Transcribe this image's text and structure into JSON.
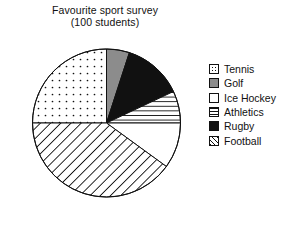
{
  "chart_data": {
    "type": "pie",
    "title": "Favourite sport survey",
    "subtitle": "(100 students)",
    "title_lines": [
      "Favourite sport survey",
      "(100 students)"
    ],
    "unit": "students",
    "total": 100,
    "categories": [
      "Tennis",
      "Golf",
      "Rugby",
      "Athletics",
      "Ice Hockey",
      "Football"
    ],
    "values": [
      25,
      5,
      13,
      7,
      10,
      40
    ],
    "legend_position": "right",
    "legend_order": [
      "Tennis",
      "Golf",
      "Ice Hockey",
      "Athletics",
      "Rugby",
      "Football"
    ],
    "slices": [
      {
        "label": "Tennis",
        "value": 25,
        "percent": 25,
        "start_angle": 270,
        "end_angle": 360,
        "fill": "dots",
        "fill_color": "#ffffff",
        "pattern_color": "#111111"
      },
      {
        "label": "Golf",
        "value": 5,
        "percent": 5,
        "start_angle": 0,
        "end_angle": 18,
        "fill": "solid",
        "fill_color": "#8c8c8c",
        "pattern_color": "#8c8c8c"
      },
      {
        "label": "Rugby",
        "value": 13,
        "percent": 13,
        "start_angle": 18,
        "end_angle": 64.8,
        "fill": "solid",
        "fill_color": "#111111",
        "pattern_color": "#111111"
      },
      {
        "label": "Athletics",
        "value": 7,
        "percent": 7,
        "start_angle": 64.8,
        "end_angle": 90,
        "fill": "horizontal-lines",
        "fill_color": "#ffffff",
        "pattern_color": "#111111"
      },
      {
        "label": "Ice Hockey",
        "value": 10,
        "percent": 10,
        "start_angle": 90,
        "end_angle": 126,
        "fill": "plain",
        "fill_color": "#ffffff",
        "pattern_color": "#111111"
      },
      {
        "label": "Football",
        "value": 40,
        "percent": 40,
        "start_angle": 126,
        "end_angle": 270,
        "fill": "diagonal-hatch",
        "fill_color": "#ffffff",
        "pattern_color": "#111111"
      }
    ],
    "geometry": {
      "center_x": 106.5,
      "center_y": 123,
      "radius": 74,
      "outline_color": "#111111"
    }
  },
  "legend": {
    "items": [
      {
        "label": "Tennis",
        "swatch": "dots-swatch",
        "swatch_class": "sw-dots"
      },
      {
        "label": "Golf",
        "swatch": "solid-gray-swatch",
        "swatch_class": "sw-solid-gray"
      },
      {
        "label": "Ice Hockey",
        "swatch": "plain-white-swatch",
        "swatch_class": "sw-plain"
      },
      {
        "label": "Athletics",
        "swatch": "horizontal-lines-swatch",
        "swatch_class": "sw-hlines"
      },
      {
        "label": "Rugby",
        "swatch": "solid-black-swatch",
        "swatch_class": "sw-solid-black"
      },
      {
        "label": "Football",
        "swatch": "diagonal-hatch-swatch",
        "swatch_class": "sw-diag"
      }
    ]
  }
}
